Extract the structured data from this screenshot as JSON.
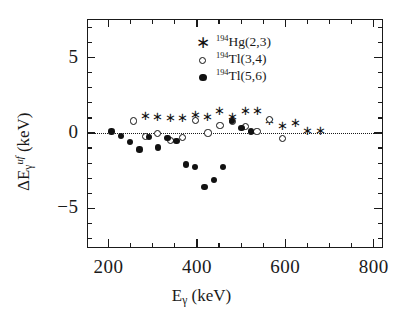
{
  "figure": {
    "background": "#ffffff",
    "ink_color": "#111111"
  },
  "axes": {
    "x_tick_labels": [
      "200",
      "400",
      "600",
      "800"
    ],
    "x_tick_values": [
      200,
      400,
      600,
      800
    ],
    "y_tick_labels": [
      "5",
      "0",
      "−5"
    ],
    "y_tick_values": [
      5,
      0,
      -5
    ],
    "xlabel_parts": {
      "symbol": "E",
      "subscript": "γ",
      "unit": "(keV)"
    },
    "ylabel_parts": {
      "delta": "Δ",
      "symbol": "E",
      "subscript": "γ",
      "superscript": "uf",
      "unit": "(keV)"
    }
  },
  "legend": {
    "position": "upper-center",
    "entries": [
      {
        "marker": "star",
        "glyph": "∗",
        "mass": "194",
        "element": "Hg",
        "spins": "(2,3)",
        "label": "¹⁹⁴Hg(2,3)"
      },
      {
        "marker": "open-circle",
        "glyph": "○",
        "mass": "194",
        "element": "Tl",
        "spins": "(3,4)",
        "label": "¹⁹⁴Tl(3,4)"
      },
      {
        "marker": "filled-circle",
        "glyph": "●",
        "mass": "194",
        "element": "Tl",
        "spins": "(5,6)",
        "label": "¹⁹⁴Tl(5,6)"
      }
    ]
  },
  "chart_data": {
    "type": "scatter",
    "title": "",
    "xlabel": "Eγ (keV)",
    "ylabel": "ΔEγ^uf (keV)",
    "xlim": [
      150,
      820
    ],
    "ylim": [
      -7.6,
      7.6
    ],
    "xticks": [
      200,
      400,
      600,
      800
    ],
    "yticks": [
      5,
      0,
      -5
    ],
    "xminor_step": 50,
    "yminor_step": 1,
    "grid": false,
    "reference_line": {
      "y": 0,
      "style": "dotted"
    },
    "series": [
      {
        "name": "¹⁹⁴Hg(2,3)",
        "marker": "star",
        "points": [
          [
            284,
            1.1
          ],
          [
            311,
            1.05
          ],
          [
            340,
            0.95
          ],
          [
            368,
            0.95
          ],
          [
            397,
            1.15
          ],
          [
            425,
            1.0
          ],
          [
            452,
            1.4
          ],
          [
            481,
            1.05
          ],
          [
            510,
            1.4
          ],
          [
            536,
            1.4
          ],
          [
            565,
            0.75
          ],
          [
            594,
            0.45
          ],
          [
            622,
            0.65
          ],
          [
            651,
            0.1
          ],
          [
            680,
            0.1
          ]
        ]
      },
      {
        "name": "¹⁹⁴Tl(3,4)",
        "marker": "open-circle",
        "points": [
          [
            256,
            0.8
          ],
          [
            284,
            -0.25
          ],
          [
            311,
            -0.05
          ],
          [
            340,
            -0.5
          ],
          [
            368,
            -0.3
          ],
          [
            397,
            0.85
          ],
          [
            425,
            0.0
          ],
          [
            452,
            0.5
          ],
          [
            481,
            0.75
          ],
          [
            510,
            0.45
          ],
          [
            536,
            0.1
          ],
          [
            565,
            0.9
          ],
          [
            594,
            -0.35
          ]
        ]
      },
      {
        "name": "¹⁹⁴Tl(5,6)",
        "marker": "filled-circle",
        "points": [
          [
            207,
            0.1
          ],
          [
            228,
            -0.2
          ],
          [
            249,
            -0.6
          ],
          [
            270,
            -1.1
          ],
          [
            291,
            -0.25
          ],
          [
            312,
            -0.95
          ],
          [
            333,
            -0.35
          ],
          [
            354,
            -0.55
          ],
          [
            375,
            -2.1
          ],
          [
            396,
            -2.25
          ],
          [
            417,
            -3.6
          ],
          [
            438,
            -3.1
          ],
          [
            459,
            -2.25
          ],
          [
            480,
            0.8
          ],
          [
            501,
            0.35
          ],
          [
            522,
            0.1
          ]
        ]
      }
    ]
  }
}
